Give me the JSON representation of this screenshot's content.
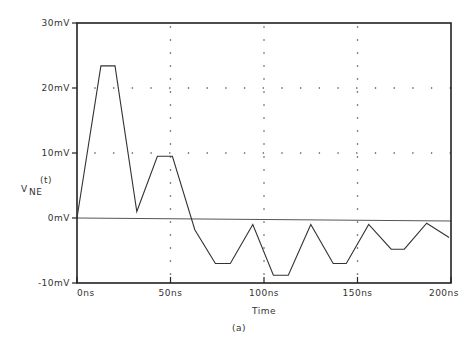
{
  "chart_data": {
    "type": "line",
    "title": "",
    "caption": "(a)",
    "xlabel": "Time",
    "ylabel": "V_NE(t)",
    "ylabel_main": "V",
    "ylabel_sub": "NE",
    "ylabel_sup": "(t)",
    "xlim": [
      0,
      200
    ],
    "ylim": [
      -10,
      30
    ],
    "x_unit": "ns",
    "y_unit": "mV",
    "x_ticks": [
      0,
      50,
      100,
      150,
      200
    ],
    "x_tick_labels": [
      "0ns",
      "50ns",
      "100ns",
      "150ns",
      "200ns"
    ],
    "y_ticks": [
      -10,
      0,
      10,
      20,
      30
    ],
    "y_tick_labels": [
      "-10mV",
      "0mV",
      "10mV",
      "20mV",
      "30mV"
    ],
    "grid": "dotted",
    "zero_line": true,
    "series": [
      {
        "name": "V_NE(t)",
        "x": [
          0,
          12.8,
          20.3,
          32,
          43,
          51,
          63,
          74,
          82,
          94,
          105,
          113,
          125,
          137,
          144,
          156,
          168,
          175,
          187,
          199
        ],
        "y": [
          0,
          23.4,
          23.4,
          1,
          9.5,
          9.5,
          -1.8,
          -7,
          -7,
          -1,
          -8.8,
          -8.8,
          -1,
          -7,
          -7,
          -1,
          -4.8,
          -4.8,
          -0.8,
          -3
        ]
      }
    ]
  }
}
